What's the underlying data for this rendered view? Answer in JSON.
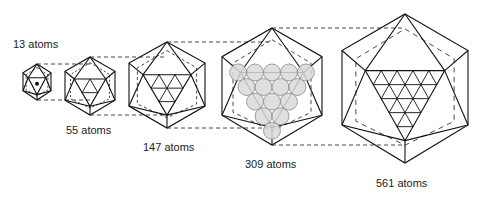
{
  "colors": {
    "stroke": "#111111",
    "dash": "#333333",
    "atom_fill": "#d9d9d9",
    "atom_stroke": "#8a8a8a"
  },
  "clusters": [
    {
      "label": "13 atoms",
      "atoms": 13,
      "cx": 37,
      "top": 64,
      "bottom": 100,
      "half_w": 14,
      "grid": 1,
      "center_dot": true,
      "label_x": 13,
      "label_y": 38
    },
    {
      "label": "55 atoms",
      "atoms": 55,
      "cx": 90,
      "top": 57,
      "bottom": 115,
      "half_w": 25,
      "grid": 2,
      "label_x": 66,
      "label_y": 124
    },
    {
      "label": "147 atoms",
      "atoms": 147,
      "cx": 167,
      "top": 42,
      "bottom": 128,
      "half_w": 38,
      "grid": 3,
      "label_x": 143,
      "label_y": 141
    },
    {
      "label": "309 atoms",
      "atoms": 309,
      "cx": 272,
      "top": 28,
      "bottom": 145,
      "half_w": 50,
      "grid": 4,
      "spheres": true,
      "label_x": 245,
      "label_y": 158
    },
    {
      "label": "561 atoms",
      "atoms": 561,
      "cx": 405,
      "top": 14,
      "bottom": 163,
      "half_w": 63,
      "grid": 5,
      "label_x": 376,
      "label_y": 177
    }
  ]
}
